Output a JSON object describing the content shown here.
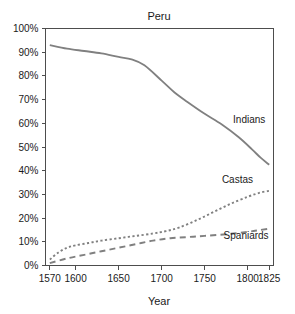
{
  "chart_data": {
    "type": "line",
    "title": "Peru",
    "xlabel": "Year",
    "ylabel": "",
    "xlim": [
      1565,
      1830
    ],
    "ylim": [
      0,
      100
    ],
    "grid": false,
    "legend_position": "inline-right-of-curve",
    "x_ticks": [
      1570,
      1600,
      1650,
      1700,
      1750,
      1800,
      1825
    ],
    "x_tick_labels": [
      "1570",
      "1600",
      "1650",
      "1700",
      "1750",
      "1800",
      "1825"
    ],
    "y_ticks": [
      0,
      10,
      20,
      30,
      40,
      50,
      60,
      70,
      80,
      90,
      100
    ],
    "y_tick_labels": [
      "0%",
      "10%",
      "20%",
      "30%",
      "40%",
      "50%",
      "60%",
      "70%",
      "80%",
      "90%",
      "100%"
    ],
    "series": [
      {
        "name": "Indians",
        "style": "solid",
        "color": "#808080",
        "label_x": 1783,
        "label_y": 60,
        "x": [
          1570,
          1590,
          1610,
          1630,
          1650,
          1665,
          1680,
          1700,
          1715,
          1730,
          1750,
          1770,
          1790,
          1805,
          1815,
          1825
        ],
        "values": [
          93,
          91.5,
          90.5,
          89.5,
          88,
          87,
          84.5,
          78,
          73,
          69,
          64,
          59.5,
          54,
          49,
          45.5,
          42.5
        ]
      },
      {
        "name": "Castas",
        "style": "dotted",
        "color": "#808080",
        "label_x": 1770,
        "label_y": 35,
        "x": [
          1570,
          1580,
          1590,
          1600,
          1615,
          1630,
          1650,
          1670,
          1690,
          1705,
          1720,
          1740,
          1760,
          1780,
          1800,
          1815,
          1825
        ],
        "values": [
          2.5,
          5.5,
          7.5,
          8.5,
          9.5,
          10.5,
          11.5,
          12.5,
          13.5,
          14.5,
          16,
          19,
          22.5,
          26,
          29,
          30.8,
          31.5
        ]
      },
      {
        "name": "Spaniards",
        "style": "dashed",
        "color": "#808080",
        "label_x": 1772,
        "label_y": 11,
        "x": [
          1570,
          1590,
          1610,
          1630,
          1650,
          1670,
          1690,
          1710,
          1730,
          1750,
          1775,
          1800,
          1815,
          1825
        ],
        "values": [
          1,
          3,
          4.5,
          6,
          7.5,
          9,
          10.5,
          11.5,
          12,
          12.5,
          13.2,
          14.2,
          15,
          15.5
        ]
      }
    ]
  }
}
